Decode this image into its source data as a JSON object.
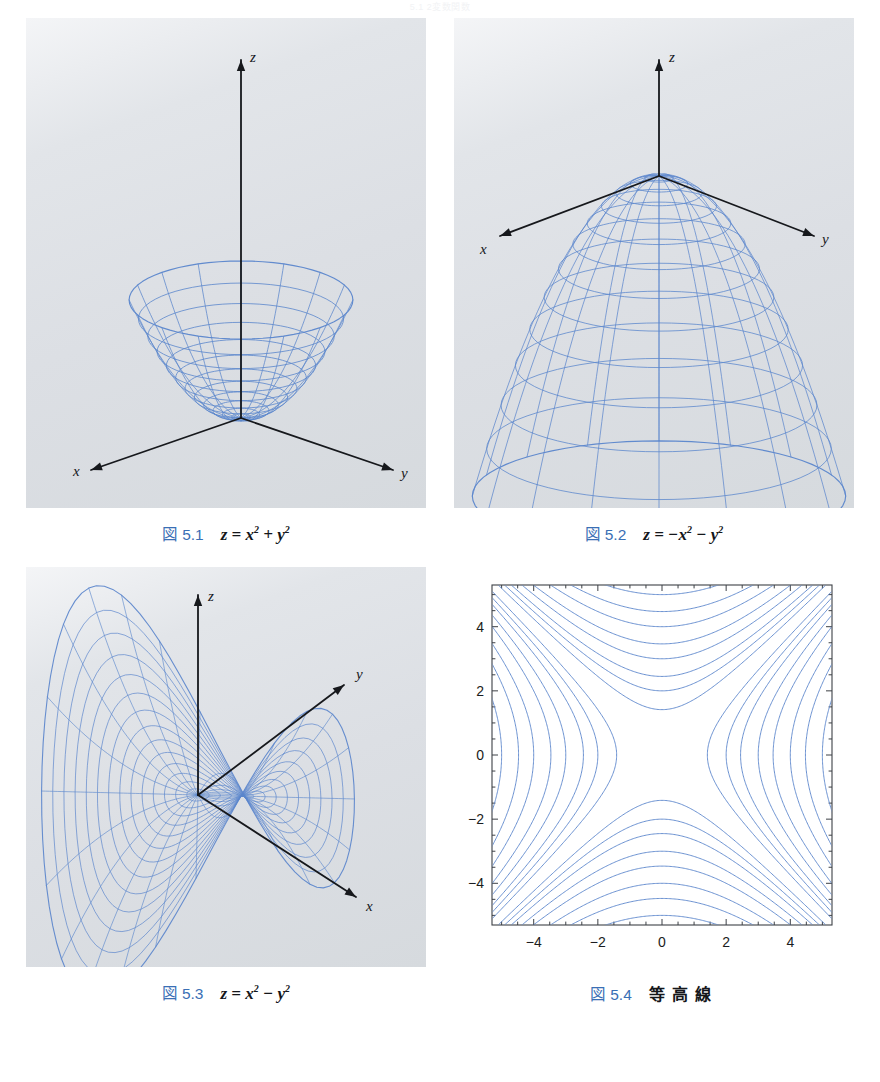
{
  "page": {
    "header": "5.1   2変数関数",
    "background": "#ffffff",
    "panel_bg": "#dcdfe4",
    "wire_color": "#5b86cc",
    "axis_color": "#16181c",
    "caption_accent": "#3a6fb5"
  },
  "figures": [
    {
      "id": "fig-5-1",
      "cap_fig": "図",
      "cap_num": "5.1",
      "cap_body": "z = x2 + y2",
      "cap_kind": "formula",
      "surface": "upward-paraboloid",
      "axes": [
        "x",
        "y",
        "z"
      ],
      "panel_w": 400,
      "panel_h": 490
    },
    {
      "id": "fig-5-2",
      "cap_fig": "図",
      "cap_num": "5.2",
      "cap_body": "z = −x2 − y2",
      "cap_kind": "formula",
      "surface": "downward-paraboloid",
      "axes": [
        "x",
        "y",
        "z"
      ],
      "panel_w": 400,
      "panel_h": 490
    },
    {
      "id": "fig-5-3",
      "cap_fig": "図",
      "cap_num": "5.3",
      "cap_body": "z = x2 − y2",
      "cap_kind": "formula",
      "surface": "saddle",
      "axes": [
        "x",
        "y",
        "z"
      ],
      "panel_w": 400,
      "panel_h": 400
    },
    {
      "id": "fig-5-4",
      "cap_fig": "図",
      "cap_num": "5.4",
      "cap_body": "等高線",
      "cap_kind": "japanese",
      "surface": "contour-plot",
      "panel_w": 400,
      "panel_h": 400
    }
  ],
  "chart_data": [
    {
      "type": "surface3d",
      "title": "z = x^2 + y^2",
      "figure": "5.1",
      "equation": "z = x^2 + y^2",
      "surface": "elliptic paraboloid opening upward",
      "xlabel": "x",
      "ylabel": "y",
      "zlabel": "z",
      "mesh": {
        "radial_rings": 12,
        "angular_lines": 16,
        "r_max": 1.0
      },
      "grid": false,
      "legend": false
    },
    {
      "type": "surface3d",
      "title": "z = -x^2 - y^2",
      "figure": "5.2",
      "equation": "z = -x^2 - y^2",
      "surface": "elliptic paraboloid opening downward",
      "xlabel": "x",
      "ylabel": "y",
      "zlabel": "z",
      "mesh": {
        "radial_rings": 13,
        "angular_lines": 16,
        "r_max": 1.0
      },
      "grid": false,
      "legend": false
    },
    {
      "type": "surface3d",
      "title": "z = x^2 - y^2",
      "figure": "5.3",
      "equation": "z = x^2 - y^2",
      "surface": "hyperbolic paraboloid (saddle)",
      "xlabel": "x",
      "ylabel": "y",
      "zlabel": "z",
      "mesh": {
        "radial_rings": 14,
        "angular_lines": 24,
        "r_max": 1.0
      },
      "grid": false,
      "legend": false
    },
    {
      "type": "contour",
      "title": "等高線",
      "figure": "5.4",
      "function": "z = x^2 - y^2",
      "xlabel": "",
      "ylabel": "",
      "xlim": [
        -5.3,
        5.3
      ],
      "ylim": [
        -5.3,
        5.3
      ],
      "xticks": [
        -4,
        -2,
        0,
        2,
        4
      ],
      "yticks": [
        -4,
        -2,
        0,
        2,
        4
      ],
      "xticklabels": [
        "−4",
        "−2",
        "0",
        "2",
        "4"
      ],
      "yticklabels": [
        "−4",
        "−2",
        "0",
        "2",
        "4"
      ],
      "levels": [
        -25,
        -20,
        -16,
        -12,
        -9,
        -6,
        -4,
        -2,
        2,
        4,
        6,
        9,
        12,
        16,
        20,
        25
      ],
      "contour_color": "#5b86cc",
      "frame": true,
      "grid": false,
      "legend": false
    }
  ]
}
